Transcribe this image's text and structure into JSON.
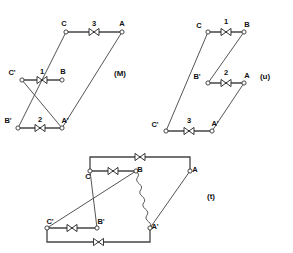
{
  "figure": {
    "background_color": "#ffffff",
    "line_color": "#555555",
    "text_color": "#111111"
  },
  "diagrams": [
    {
      "id": "M",
      "caption": "(M)",
      "caption_pos": {
        "x": 120,
        "y": 76
      },
      "terminals": [
        {
          "label": "C",
          "x": 66,
          "y": 32,
          "label_dx": -2,
          "label_dy": -6
        },
        {
          "label": "A",
          "x": 122,
          "y": 32,
          "label_dx": 0,
          "label_dy": -6
        },
        {
          "label": "C'",
          "x": 22,
          "y": 80,
          "label_dx": -10,
          "label_dy": -5
        },
        {
          "label": "B",
          "x": 62,
          "y": 80,
          "label_dx": 1,
          "label_dy": -6
        },
        {
          "label": "B'",
          "x": 18,
          "y": 128,
          "label_dx": -10,
          "label_dy": -5
        },
        {
          "label": "A'",
          "x": 62,
          "y": 128,
          "label_dx": 3,
          "label_dy": -5
        }
      ],
      "coils": [
        {
          "number": "3",
          "from": "C",
          "to": "A",
          "num_x": 94,
          "num_y": 26
        },
        {
          "number": "1",
          "from": "C'",
          "to": "B",
          "num_x": 42,
          "num_y": 74
        },
        {
          "number": "2",
          "from": "B'",
          "to": "A'",
          "num_x": 40,
          "num_y": 122
        }
      ],
      "connections": [
        {
          "from": "C",
          "to": "B'"
        },
        {
          "from": "C'",
          "to": "A'"
        },
        {
          "from": "A",
          "to": "A'"
        }
      ]
    },
    {
      "id": "u",
      "caption": "(u)",
      "caption_pos": {
        "x": 265,
        "y": 79
      },
      "terminals": [
        {
          "label": "C",
          "x": 208,
          "y": 32,
          "label_dx": -9,
          "label_dy": -4
        },
        {
          "label": "B",
          "x": 244,
          "y": 32,
          "label_dx": 3,
          "label_dy": -5
        },
        {
          "label": "B'",
          "x": 208,
          "y": 83,
          "label_dx": -11,
          "label_dy": -4
        },
        {
          "label": "A",
          "x": 244,
          "y": 83,
          "label_dx": 3,
          "label_dy": -5
        },
        {
          "label": "C'",
          "x": 166,
          "y": 131,
          "label_dx": -11,
          "label_dy": -4
        },
        {
          "label": "A'",
          "x": 212,
          "y": 131,
          "label_dx": 3,
          "label_dy": -5
        }
      ],
      "coils": [
        {
          "number": "1",
          "from": "C",
          "to": "B",
          "num_x": 226,
          "num_y": 24
        },
        {
          "number": "2",
          "from": "B'",
          "to": "A",
          "num_x": 226,
          "num_y": 75
        },
        {
          "number": "3",
          "from": "C'",
          "to": "A'",
          "num_x": 189,
          "num_y": 123
        }
      ],
      "connections": [
        {
          "from": "C",
          "to": "C'"
        },
        {
          "from": "B",
          "to": "B'"
        },
        {
          "from": "A",
          "to": "A'"
        }
      ]
    },
    {
      "id": "t",
      "caption": "(t)",
      "caption_pos": {
        "x": 211,
        "y": 199
      },
      "terminals": [
        {
          "label": "C",
          "x": 90,
          "y": 171,
          "label_dx": -2,
          "label_dy": 8
        },
        {
          "label": "B",
          "x": 136,
          "y": 171,
          "label_dx": 4,
          "label_dy": 1
        },
        {
          "label": "A",
          "x": 190,
          "y": 171,
          "label_dx": 5,
          "label_dy": 1
        },
        {
          "label": "C'",
          "x": 47,
          "y": 228,
          "label_dx": 3,
          "label_dy": -4
        },
        {
          "label": "B'",
          "x": 97,
          "y": 228,
          "label_dx": 4,
          "label_dy": -4
        },
        {
          "label": "A'",
          "x": 150,
          "y": 228,
          "label_dx": 5,
          "label_dy": 1
        }
      ],
      "coils": [
        {
          "number": "",
          "from": "C",
          "to": "B",
          "num_x": 113,
          "num_y": 166
        },
        {
          "number": "",
          "from": "C'",
          "to": "B'",
          "num_x": 72,
          "num_y": 240
        }
      ],
      "connections": [
        {
          "from": "C",
          "to": "B'",
          "style": "straight"
        },
        {
          "from": "C'",
          "to": "B",
          "style": "straight"
        },
        {
          "from": "A",
          "to": "A'",
          "style": "straight"
        },
        {
          "from": "B",
          "to": "A'",
          "style": "wavy"
        }
      ],
      "rails": [
        {
          "name": "top-rail",
          "note": "C up, right through valve, down to A"
        },
        {
          "name": "bottom-rail",
          "note": "C' down, right through valve, up to A'"
        }
      ]
    }
  ],
  "symbols": {
    "valve": "bowtie-valve-symbol",
    "node": "open-circle-terminal",
    "wavy": "wavy-connection-line"
  }
}
